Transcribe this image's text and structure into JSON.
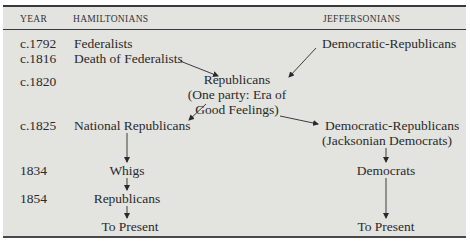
{
  "headers": {
    "year": "YEAR",
    "hamiltonians": "HAMILTONIANS",
    "jeffersonians": "JEFFERSONIANS"
  },
  "years": [
    "c.1792",
    "c.1816",
    "c.1820",
    "c.1825",
    "1834",
    "1854"
  ],
  "hamiltonians": {
    "federalists": "Federalists",
    "death_of_federalists": "Death of Federalists",
    "national_republicans": "National Republicans",
    "whigs": "Whigs",
    "republicans": "Republicans",
    "to_present": "To Present"
  },
  "center": {
    "republicans": "Republicans",
    "line2": "(One party: Era of",
    "line3": "Good Feelings)"
  },
  "jeffersonians": {
    "democratic_republicans": "Democratic-Republicans",
    "democratic_republicans_2": "Democratic-Republicans",
    "jacksonian": "(Jacksonian Democrats)",
    "democrats": "Democrats",
    "to_present": "To Present"
  },
  "colors": {
    "background": "#e3e3e0",
    "rule": "#3a3a3a",
    "text": "#2a2a2a"
  }
}
